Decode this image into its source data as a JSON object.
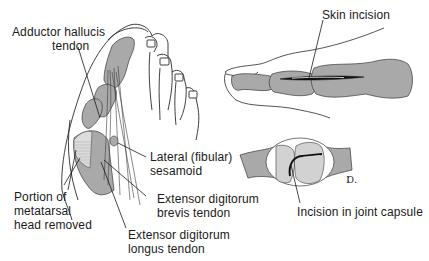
{
  "figure": {
    "panels": [
      {
        "id": "foot-dorsal-view",
        "description": "Dorsal view of forefoot with tendons and removed metatarsal head portion"
      },
      {
        "id": "toe-skin-incision",
        "description": "Lateral view of great toe with dorsal skin incision"
      },
      {
        "id": "joint-capsule-incision",
        "description": "Metatarsophalangeal joint with capsular incision"
      }
    ],
    "labels": {
      "adductor_line1": "Adductor hallucis",
      "adductor_line2": "tendon",
      "lateral_line1": "Lateral (fibular)",
      "lateral_line2": "sesamoid",
      "portion_line1": "Portion of",
      "portion_line2": "metatarsal",
      "portion_line3": "head removed",
      "ext_brevis_line1": "Extensor digitorum",
      "ext_brevis_line2": "brevis tendon",
      "ext_longus_line1": "Extensor digitorum",
      "ext_longus_line2": "longus tendon",
      "skin_incision": "Skin incision",
      "joint_capsule": "Incision in joint capsule",
      "artist_mark": "Ɒ."
    },
    "colors": {
      "bone_fill": "#a9a9a9",
      "light_fill": "#d2d2d2",
      "outline": "#2a2a2a",
      "background": "#ffffff"
    }
  }
}
